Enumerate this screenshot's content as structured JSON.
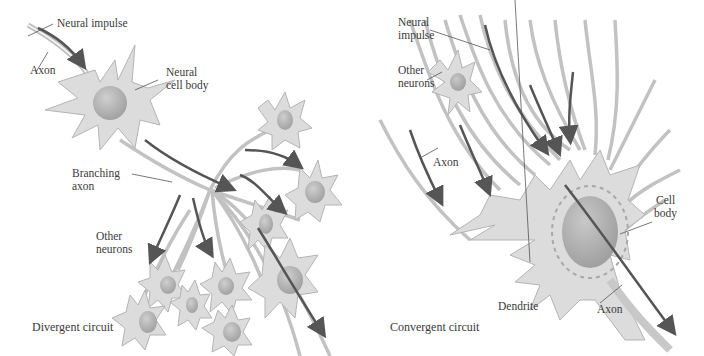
{
  "figure": {
    "colors": {
      "background": "#ffffff",
      "cell_fill": "#dcdcdc",
      "cell_stroke": "#b4b4b4",
      "nucleus": "#b0b0b0",
      "impulse_arrow": "#555555",
      "label_text": "#3a3a3a",
      "leader_line": "#555555"
    },
    "left_panel": {
      "caption": "Divergent circuit",
      "labels": {
        "neural_impulse": "Neural impulse",
        "axon": "Axon",
        "neural_cell_body_line1": "Neural",
        "neural_cell_body_line2": "cell body",
        "branching_axon_line1": "Branching",
        "branching_axon_line2": "axon",
        "other_neurons_line1": "Other",
        "other_neurons_line2": "neurons"
      }
    },
    "right_panel": {
      "caption": "Convergent circuit",
      "labels": {
        "neural_impulse_line1": "Neural",
        "neural_impulse_line2": "impulse",
        "other_neurons_line1": "Other",
        "other_neurons_line2": "neurons",
        "axon_left": "Axon",
        "cell_body_line1": "Cell",
        "cell_body_line2": "body",
        "dendrite": "Dendrite",
        "axon_bottom": "Axon"
      }
    }
  }
}
